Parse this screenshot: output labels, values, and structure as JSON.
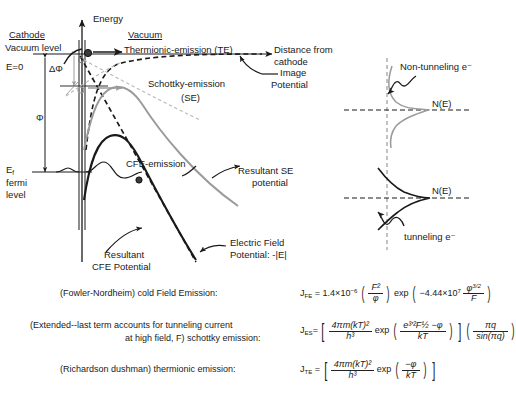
{
  "figure": {
    "left_panel": {
      "axis_energy_label": "Energy",
      "axis_distance_label_line1": "Distance from",
      "axis_distance_label_line2": "cathode",
      "region_cathode": "Cathode",
      "region_vacuum": "Vacuum",
      "vacuum_level": "Vacuum level",
      "e_zero": "E=0",
      "delta_phi": "ΔΦ",
      "phi": "Φ",
      "ef_symbol": "E",
      "ef_subscript": "f",
      "ef_line2": "fermi",
      "ef_line3": "level",
      "thermionic": "Thermionic-emission (TE)",
      "schottky_line1": "Schottky-emission",
      "schottky_line2": "(SE)",
      "image_potential_line1": "Image",
      "image_potential_line2": "Potential",
      "cfe_emission": "CFE-emission",
      "resultant_se_line1": "Resultant SE",
      "resultant_se_line2": "potential",
      "resultant_cfe_line1": "Resultant",
      "resultant_cfe_line2": "CFE Potential",
      "electric_field_line1": "Electric Field",
      "electric_field_line2": "Potential: -|E|"
    },
    "right_panel": {
      "non_tunneling": "Non-tunneling e⁻",
      "ne_top": "N(E)",
      "ne_bottom": "N(E)",
      "tunneling": "tunneling e⁻"
    },
    "colors": {
      "black": "#1a1a1a",
      "gray": "#9a9a9a",
      "dashed_gray": "#b5b5b5"
    }
  },
  "equations": [
    {
      "name": "fowler-nordheim",
      "label": "(Fowler-Nordheim) cold Field Emission:",
      "lhs": "J",
      "lhs_sub": "FE",
      "coefficient": "1.4×10",
      "coefficient_exp": "−6",
      "frac1_num": "F²",
      "frac1_den": "φ",
      "exp_word": "exp",
      "exp_coeff": "−4.44×10",
      "exp_coeff_exp": "7",
      "frac2_num": "φ",
      "frac2_num_exp": "3/2",
      "frac2_den": "F"
    },
    {
      "name": "extended-schottky",
      "label_line1": "(Extended--last term accounts for tunneling current",
      "label_line2": "at high field, F) schottky emission:",
      "lhs": "J",
      "lhs_sub": "ES",
      "frac1_num": "4πm(kT)²",
      "frac1_den": "h³",
      "exp_word": "exp",
      "frac2_num": "e³′²F½ −φ",
      "frac2_den": "kT",
      "frac3_num": "πq",
      "frac3_den": "sin(πq)"
    },
    {
      "name": "richardson-dushman",
      "label": "(Richardson dushman) thermionic emission:",
      "lhs": "J",
      "lhs_sub": "TE",
      "frac1_num": "4πm(kT)²",
      "frac1_den": "h³",
      "exp_word": "exp",
      "frac2_num": "−φ",
      "frac2_den": "kT"
    }
  ]
}
